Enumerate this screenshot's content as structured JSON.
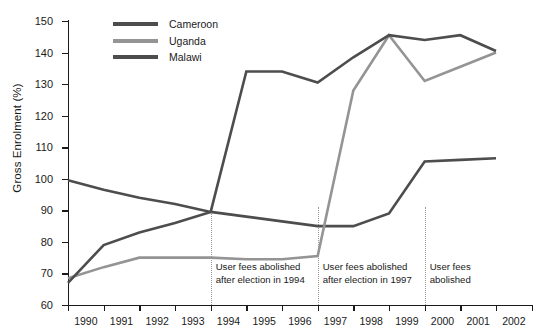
{
  "chart_data": {
    "type": "line",
    "title": "",
    "xlabel": "",
    "ylabel": "Gross Enrolment (%)",
    "x": [
      1990,
      1991,
      1992,
      1993,
      1994,
      1995,
      1996,
      1997,
      1998,
      1999,
      2000,
      2001,
      2002
    ],
    "xticklabels": [
      "1990",
      "1991",
      "1992",
      "1993",
      "1994",
      "1995",
      "1996",
      "1997",
      "1998",
      "1999",
      "2000",
      "2001",
      "2002"
    ],
    "xlim": [
      1990,
      2002
    ],
    "ylim": [
      60,
      150
    ],
    "yticks": [
      60,
      70,
      80,
      90,
      100,
      110,
      120,
      130,
      140,
      150
    ],
    "yticklabels": [
      "60",
      "70",
      "80",
      "90",
      "100",
      "110",
      "120",
      "130",
      "140",
      "150"
    ],
    "grid": false,
    "legend_position": "top-left-inside",
    "series": [
      {
        "name": "Cameroon",
        "color": "#4d4d4d",
        "values": [
          99.5,
          96.5,
          94.0,
          92.0,
          89.5,
          88.0,
          86.5,
          85.0,
          85.0,
          89.0,
          105.5,
          106.0,
          106.5
        ]
      },
      {
        "name": "Uganda",
        "color": "#949494",
        "values": [
          68.5,
          72.0,
          75.0,
          75.0,
          75.0,
          74.5,
          74.5,
          75.5,
          128.0,
          145.5,
          131.0,
          135.5,
          140.0
        ]
      },
      {
        "name": "Malawi",
        "color": "#4d4d4d",
        "values": [
          67.0,
          79.0,
          83.0,
          86.0,
          89.5,
          134.0,
          134.0,
          130.5,
          138.5,
          145.5,
          144.0,
          145.5,
          140.5
        ]
      }
    ],
    "annotations": [
      {
        "text": "User fees abolished\nafter election in 1994",
        "at_x": 1994
      },
      {
        "text": "User fees abolished\nafter election in 1997",
        "at_x": 1997
      },
      {
        "text": "User fees abolished",
        "at_x": 2000
      }
    ],
    "vertical_markers": [
      1994,
      1997,
      2000
    ]
  },
  "legend": {
    "items": [
      {
        "label": "Cameroon",
        "color": "#4d4d4d"
      },
      {
        "label": "Uganda",
        "color": "#949494"
      },
      {
        "label": "Malawi",
        "color": "#4d4d4d"
      }
    ]
  }
}
